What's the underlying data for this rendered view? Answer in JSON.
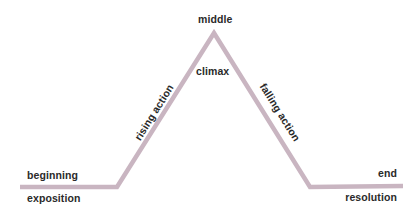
{
  "diagram": {
    "type": "plot-structure",
    "line_color": "#c9b5c1",
    "text_color": "#2a2a2a",
    "path_points": [
      [
        20,
        187
      ],
      [
        117,
        187
      ],
      [
        214,
        33
      ],
      [
        310,
        187
      ],
      [
        403,
        186
      ]
    ],
    "labels": {
      "top": "middle",
      "peak": "climax",
      "rising": "rising action",
      "falling": "falling action",
      "start_above": "beginning",
      "start_below": "exposition",
      "end_above": "end",
      "end_below": "resolution"
    }
  }
}
